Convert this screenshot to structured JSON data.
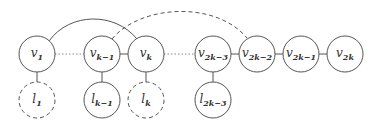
{
  "diagram": {
    "type": "graph",
    "colors": {
      "stroke": "#555555",
      "dotted_edge": "#888888",
      "background": "#ffffff"
    },
    "nodes": [
      {
        "id": "v1",
        "base": "v",
        "sub": "1",
        "x": 37,
        "y": 54,
        "style": "solid"
      },
      {
        "id": "vk-1",
        "base": "v",
        "sub": "k−1",
        "x": 102,
        "y": 54,
        "style": "solid"
      },
      {
        "id": "vk",
        "base": "v",
        "sub": "k",
        "x": 146,
        "y": 54,
        "style": "solid"
      },
      {
        "id": "v2k-3",
        "base": "v",
        "sub": "2k−3",
        "x": 213,
        "y": 54,
        "style": "solid"
      },
      {
        "id": "v2k-2",
        "base": "v",
        "sub": "2k−2",
        "x": 257,
        "y": 54,
        "style": "solid"
      },
      {
        "id": "v2k-1",
        "base": "v",
        "sub": "2k−1",
        "x": 301,
        "y": 54,
        "style": "solid"
      },
      {
        "id": "v2k",
        "base": "v",
        "sub": "2k",
        "x": 345,
        "y": 54,
        "style": "solid"
      },
      {
        "id": "l1",
        "base": "l",
        "sub": "1",
        "x": 37,
        "y": 100,
        "style": "dashed"
      },
      {
        "id": "lk-1",
        "base": "l",
        "sub": "k−1",
        "x": 102,
        "y": 100,
        "style": "solid"
      },
      {
        "id": "lk",
        "base": "l",
        "sub": "k",
        "x": 146,
        "y": 100,
        "style": "dashed"
      },
      {
        "id": "l2k-3",
        "base": "l",
        "sub": "2k−3",
        "x": 213,
        "y": 100,
        "style": "solid"
      }
    ],
    "edges": [
      {
        "from": "v1",
        "to": "vk-1",
        "style": "dotted"
      },
      {
        "from": "vk-1",
        "to": "vk",
        "style": "solid"
      },
      {
        "from": "vk",
        "to": "v2k-3",
        "style": "dotted"
      },
      {
        "from": "v2k-3",
        "to": "v2k-2",
        "style": "solid"
      },
      {
        "from": "v2k-2",
        "to": "v2k-1",
        "style": "solid"
      },
      {
        "from": "v2k-1",
        "to": "v2k",
        "style": "solid"
      },
      {
        "from": "v1",
        "to": "l1",
        "style": "solid"
      },
      {
        "from": "vk-1",
        "to": "lk-1",
        "style": "solid"
      },
      {
        "from": "vk",
        "to": "lk",
        "style": "solid"
      },
      {
        "from": "v2k-3",
        "to": "l2k-3",
        "style": "solid"
      },
      {
        "from": "v1",
        "to": "vk",
        "style": "solid-arc"
      },
      {
        "from": "vk-1",
        "to": "v2k-2",
        "style": "dashed-arc"
      }
    ]
  }
}
